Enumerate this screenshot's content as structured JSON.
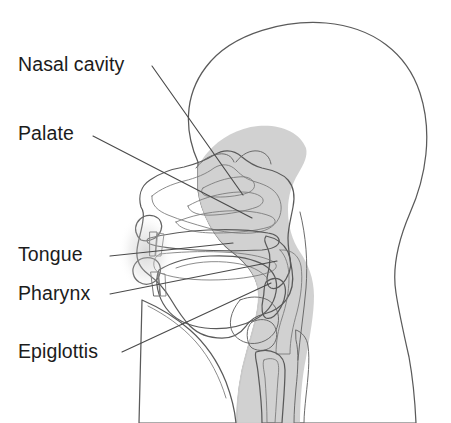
{
  "figure": {
    "background_color": "#ffffff",
    "width": 451,
    "height": 423
  },
  "palette": {
    "head_fill": "#f2f2f2",
    "head_outline": "#5a5a5a",
    "tissue_light": "#d8d8d8",
    "tissue_mid": "#c2c2c2",
    "tissue_dark": "#a8a8a8",
    "tissue_darkest": "#989898",
    "cavity_white": "#ffffff",
    "leader_line": "#4a4a4a",
    "label_text": "#1c1c1c"
  },
  "labels": [
    {
      "id": "nasal-cavity",
      "text": "Nasal cavity",
      "x": 18,
      "y": 71,
      "leader": {
        "x1": 152,
        "y1": 66,
        "x2": 243,
        "y2": 195
      }
    },
    {
      "id": "palate",
      "text": "Palate",
      "x": 18,
      "y": 140,
      "leader": {
        "x1": 93,
        "y1": 136,
        "x2": 252,
        "y2": 218
      }
    },
    {
      "id": "tongue",
      "text": "Tongue",
      "x": 18,
      "y": 261,
      "leader": {
        "x1": 110,
        "y1": 256,
        "x2": 233,
        "y2": 243
      }
    },
    {
      "id": "pharynx",
      "text": "Pharynx",
      "x": 18,
      "y": 300,
      "leader": {
        "x1": 110,
        "y1": 294,
        "x2": 277,
        "y2": 261
      }
    },
    {
      "id": "epiglottis",
      "text": "Epiglottis",
      "x": 18,
      "y": 358,
      "leader": {
        "x1": 122,
        "y1": 352,
        "x2": 271,
        "y2": 283
      }
    }
  ],
  "structures": [
    {
      "id": "head-profile",
      "name": "Head and neck profile"
    },
    {
      "id": "nasal-cavity-region",
      "name": "Nasal cavity with turbinates"
    },
    {
      "id": "hard-palate",
      "name": "Hard palate"
    },
    {
      "id": "soft-palate",
      "name": "Soft palate and uvula"
    },
    {
      "id": "tongue-body",
      "name": "Tongue"
    },
    {
      "id": "pharynx-region",
      "name": "Pharynx"
    },
    {
      "id": "epiglottis-flap",
      "name": "Epiglottis"
    },
    {
      "id": "larynx-trachea",
      "name": "Larynx and trachea"
    },
    {
      "id": "esophagus",
      "name": "Esophagus"
    },
    {
      "id": "teeth",
      "name": "Teeth"
    },
    {
      "id": "lips",
      "name": "Lips"
    },
    {
      "id": "mandible",
      "name": "Mandible and chin"
    }
  ]
}
